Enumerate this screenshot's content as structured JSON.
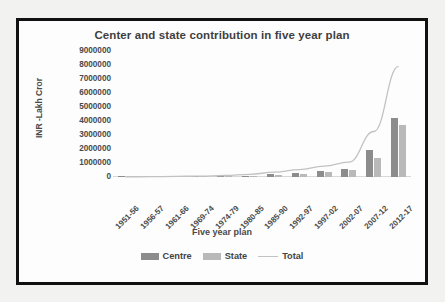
{
  "figure": {
    "frame_color": "#111111",
    "background": "#ffffff"
  },
  "chart_data": {
    "type": "bar",
    "title": "Center and state contribution in five year plan",
    "xlabel": "Five year plan",
    "ylabel": "INR -Lakh Cror",
    "grid": false,
    "legend_position": "bottom",
    "ylim": [
      0,
      9000000
    ],
    "ytick_labels": [
      "9000000",
      "8000000",
      "7000000",
      "6000000",
      "5000000",
      "4000000",
      "3000000",
      "2000000",
      "1000000",
      "0"
    ],
    "yticks": [
      9000000,
      8000000,
      7000000,
      6000000,
      5000000,
      4000000,
      3000000,
      2000000,
      1000000,
      0
    ],
    "categories": [
      "1951-56",
      "1956-57",
      "1961-66",
      "1969-74",
      "1974-79",
      "1980-85",
      "1985-90",
      "1992-97",
      "1997-02",
      "2002-07",
      "2007-12",
      "2012-17"
    ],
    "series": [
      {
        "name": "Centre",
        "kind": "bar",
        "color": "#8c8c8c",
        "values": [
          9000,
          14000,
          22000,
          35000,
          60000,
          105000,
          190000,
          290000,
          430000,
          590000,
          1900000,
          4200000
        ]
      },
      {
        "name": "State",
        "kind": "bar",
        "color": "#b9b9b9",
        "values": [
          7000,
          11000,
          18000,
          28000,
          48000,
          85000,
          150000,
          230000,
          350000,
          470000,
          1350000,
          3700000
        ]
      },
      {
        "name": "Total",
        "kind": "line",
        "color": "#c2c2c2",
        "values": [
          16000,
          25000,
          40000,
          63000,
          108000,
          190000,
          340000,
          520000,
          780000,
          1060000,
          3250000,
          7900000
        ]
      }
    ]
  },
  "legend": {
    "items": [
      {
        "label": "Centre",
        "swatch": "centre"
      },
      {
        "label": "State",
        "swatch": "state"
      },
      {
        "label": "Total",
        "swatch": "total"
      }
    ]
  }
}
